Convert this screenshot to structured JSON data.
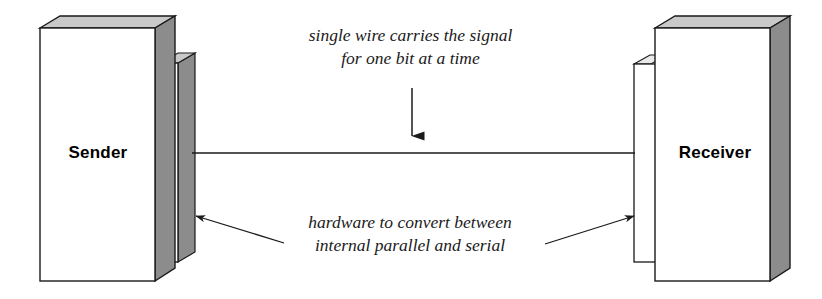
{
  "figure": {
    "type": "serial-transmission-diagram",
    "background_color": "#ffffff",
    "line_color": "#1a1a1a"
  },
  "nodes": [
    {
      "id": "sender",
      "label": "Sender",
      "icon": "3d-box-icon",
      "front_face_color": "#ffffff",
      "top_face_color": "#c9c9c9",
      "side_face_color": "#8c8c8c"
    },
    {
      "id": "receiver",
      "label": "Receiver",
      "icon": "3d-box-icon",
      "front_face_color": "#ffffff",
      "top_face_color": "#c9c9c9",
      "side_face_color": "#8c8c8c"
    }
  ],
  "adapters": [
    {
      "id": "sender-adapter",
      "icon": "serial-adapter-icon",
      "attached_to": "sender",
      "face_color": "#ffffff",
      "shade_color": "#8c8c8c"
    },
    {
      "id": "receiver-adapter",
      "icon": "serial-adapter-icon",
      "attached_to": "receiver",
      "face_color": "#ffffff",
      "shade_color": "#8c8c8c"
    }
  ],
  "connections": [
    {
      "id": "serial-wire",
      "icon": "wire-line-icon",
      "from": "sender-adapter",
      "to": "receiver-adapter",
      "style": "single-line"
    }
  ],
  "annotations": [
    {
      "id": "wire-annotation",
      "icon": "down-arrow-icon",
      "line1": "single wire carries the signal",
      "line2": "for one bit at a time",
      "points_to": "serial-wire"
    },
    {
      "id": "hardware-annotation",
      "icon": "leader-arrow-icon",
      "line1": "hardware to convert between",
      "line2": "internal parallel and serial",
      "points_to": [
        "sender-adapter",
        "receiver-adapter"
      ]
    }
  ]
}
